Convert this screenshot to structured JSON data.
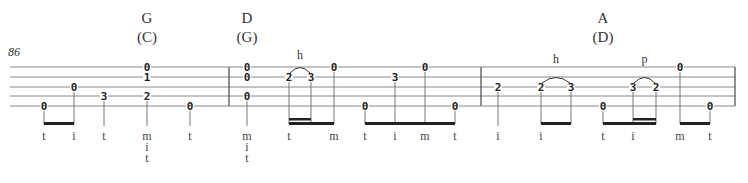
{
  "measure_number": "86",
  "chords": [
    {
      "name": "G",
      "capo": "(C)",
      "x": 147
    },
    {
      "name": "D",
      "capo": "(G)",
      "x": 247
    },
    {
      "name": "A",
      "capo": "(D)",
      "x": 603
    }
  ],
  "staff": {
    "x1": 10,
    "x2": 735,
    "lines_y": [
      67,
      77,
      87,
      96,
      106
    ]
  },
  "barlines": [
    229,
    481,
    735
  ],
  "notes": [
    {
      "x": 44,
      "frets": [
        {
          "s": 4,
          "f": "0"
        }
      ],
      "fingers": [
        "t"
      ]
    },
    {
      "x": 74,
      "frets": [
        {
          "s": 2,
          "f": "0"
        }
      ],
      "fingers": [
        "i"
      ]
    },
    {
      "x": 104,
      "frets": [
        {
          "s": 3,
          "f": "3"
        }
      ],
      "fingers": [
        "t"
      ]
    },
    {
      "x": 147,
      "frets": [
        {
          "s": 0,
          "f": "0"
        },
        {
          "s": 1,
          "f": "1"
        },
        {
          "s": 3,
          "f": "2"
        }
      ],
      "fingers": [
        "m",
        "i",
        "t"
      ]
    },
    {
      "x": 190,
      "frets": [
        {
          "s": 4,
          "f": "0"
        }
      ],
      "fingers": [
        "t"
      ]
    },
    {
      "x": 247,
      "frets": [
        {
          "s": 0,
          "f": "0"
        },
        {
          "s": 1,
          "f": "0"
        },
        {
          "s": 3,
          "f": "0"
        }
      ],
      "fingers": [
        "m",
        "i",
        "t"
      ]
    },
    {
      "x": 289,
      "frets": [
        {
          "s": 1,
          "f": "2"
        }
      ],
      "fingers": [
        "t"
      ]
    },
    {
      "x": 311,
      "frets": [
        {
          "s": 1,
          "f": "3"
        }
      ],
      "fingers": []
    },
    {
      "x": 334,
      "frets": [
        {
          "s": 0,
          "f": "0"
        }
      ],
      "fingers": [
        "m"
      ]
    },
    {
      "x": 365,
      "frets": [
        {
          "s": 4,
          "f": "0"
        }
      ],
      "fingers": [
        "t"
      ]
    },
    {
      "x": 395,
      "frets": [
        {
          "s": 1,
          "f": "3"
        }
      ],
      "fingers": [
        "i"
      ]
    },
    {
      "x": 425,
      "frets": [
        {
          "s": 0,
          "f": "0"
        }
      ],
      "fingers": [
        "m"
      ]
    },
    {
      "x": 455,
      "frets": [
        {
          "s": 4,
          "f": "0"
        }
      ],
      "fingers": [
        "t"
      ]
    },
    {
      "x": 498,
      "frets": [
        {
          "s": 2,
          "f": "2"
        }
      ],
      "fingers": [
        "i"
      ]
    },
    {
      "x": 541,
      "frets": [
        {
          "s": 2,
          "f": "2"
        }
      ],
      "fingers": [
        "i"
      ]
    },
    {
      "x": 571,
      "frets": [
        {
          "s": 2,
          "f": "3"
        }
      ],
      "fingers": []
    },
    {
      "x": 603,
      "frets": [
        {
          "s": 4,
          "f": "0"
        }
      ],
      "fingers": [
        "t"
      ]
    },
    {
      "x": 633,
      "frets": [
        {
          "s": 2,
          "f": "3"
        }
      ],
      "fingers": [
        "i"
      ]
    },
    {
      "x": 656,
      "frets": [
        {
          "s": 2,
          "f": "2"
        }
      ],
      "fingers": []
    },
    {
      "x": 680,
      "frets": [
        {
          "s": 0,
          "f": "0"
        }
      ],
      "fingers": [
        "m"
      ]
    },
    {
      "x": 710,
      "frets": [
        {
          "s": 4,
          "f": "0"
        }
      ],
      "fingers": [
        "t"
      ]
    }
  ],
  "beams": [
    {
      "x1": 44,
      "x2": 74,
      "double": null
    },
    {
      "x1": 289,
      "x2": 334,
      "double": [
        289,
        311
      ]
    },
    {
      "x1": 365,
      "x2": 455,
      "double": null
    },
    {
      "x1": 541,
      "x2": 571,
      "double": null
    },
    {
      "x1": 603,
      "x2": 656,
      "double": [
        633,
        656
      ]
    },
    {
      "x1": 680,
      "x2": 710,
      "double": null
    }
  ],
  "techniques": [
    {
      "label": "h",
      "x1": 289,
      "x2": 311,
      "y": 76
    },
    {
      "label": "h",
      "x1": 541,
      "x2": 571,
      "y": 86
    },
    {
      "label": "p",
      "x1": 633,
      "x2": 656,
      "y": 86
    }
  ]
}
